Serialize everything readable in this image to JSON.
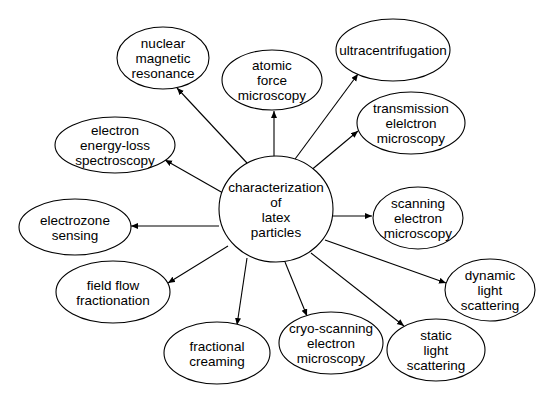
{
  "diagram": {
    "type": "mind-map",
    "center": {
      "id": "center",
      "lines": [
        "characterization",
        "of",
        "latex",
        "particles"
      ],
      "cx": 276,
      "cy": 209,
      "rx": 57,
      "ry": 53
    },
    "nodes": [
      {
        "id": "nmr",
        "lines": [
          "nuclear",
          "magnetic",
          "resonance"
        ],
        "cx": 163,
        "cy": 58,
        "rx": 46,
        "ry": 31,
        "arrow_from": [
          247,
          163
        ],
        "arrow_to": [
          177,
          88
        ]
      },
      {
        "id": "afm",
        "lines": [
          "atomic",
          "force",
          "microscopy"
        ],
        "cx": 272,
        "cy": 80,
        "rx": 50,
        "ry": 30,
        "arrow_from": [
          274,
          156
        ],
        "arrow_to": [
          274,
          111
        ]
      },
      {
        "id": "ultracentrifugation",
        "lines": [
          "ultracentrifugation"
        ],
        "cx": 393,
        "cy": 50,
        "rx": 57,
        "ry": 31,
        "arrow_from": [
          284,
          174
        ],
        "arrow_to": [
          358,
          74
        ]
      },
      {
        "id": "tem",
        "lines": [
          "transmission",
          "elelctron",
          "microscopy"
        ],
        "cx": 411,
        "cy": 123,
        "rx": 54,
        "ry": 31,
        "arrow_from": [
          303,
          177
        ],
        "arrow_to": [
          358,
          131
        ]
      },
      {
        "id": "eels",
        "lines": [
          "electron",
          "energy-loss",
          "spectroscopy"
        ],
        "cx": 115,
        "cy": 145,
        "rx": 60,
        "ry": 28,
        "arrow_from": [
          223,
          193
        ],
        "arrow_to": [
          165,
          160
        ]
      },
      {
        "id": "electrozone",
        "lines": [
          "electrozone",
          "sensing"
        ],
        "cx": 75,
        "cy": 227,
        "rx": 56,
        "ry": 28,
        "arrow_from": [
          219,
          226
        ],
        "arrow_to": [
          131,
          226
        ]
      },
      {
        "id": "sem",
        "lines": [
          "scanning",
          "electron",
          "microscopy"
        ],
        "cx": 418,
        "cy": 218,
        "rx": 45,
        "ry": 31,
        "arrow_from": [
          333,
          216
        ],
        "arrow_to": [
          372,
          216
        ]
      },
      {
        "id": "fff",
        "lines": [
          "field flow",
          "fractionation"
        ],
        "cx": 113,
        "cy": 292,
        "rx": 57,
        "ry": 31,
        "arrow_from": [
          228,
          246
        ],
        "arrow_to": [
          168,
          283
        ]
      },
      {
        "id": "dls",
        "lines": [
          "dynamic",
          "light",
          "scattering"
        ],
        "cx": 490,
        "cy": 290,
        "rx": 45,
        "ry": 31,
        "arrow_from": [
          325,
          240
        ],
        "arrow_to": [
          446,
          283
        ]
      },
      {
        "id": "fractional-creaming",
        "lines": [
          "fractional",
          "creaming"
        ],
        "cx": 217,
        "cy": 353,
        "rx": 53,
        "ry": 31,
        "arrow_from": [
          247,
          258
        ],
        "arrow_to": [
          237,
          325
        ]
      },
      {
        "id": "cryo-sem",
        "lines": [
          "cryo-scanning",
          "electron",
          "microscopy"
        ],
        "cx": 331,
        "cy": 343,
        "rx": 52,
        "ry": 31,
        "arrow_from": [
          285,
          262
        ],
        "arrow_to": [
          307,
          316
        ]
      },
      {
        "id": "sls",
        "lines": [
          "static",
          "light",
          "scattering"
        ],
        "cx": 436,
        "cy": 350,
        "rx": 49,
        "ry": 31,
        "arrow_from": [
          311,
          253
        ],
        "arrow_to": [
          404,
          326
        ]
      }
    ]
  }
}
